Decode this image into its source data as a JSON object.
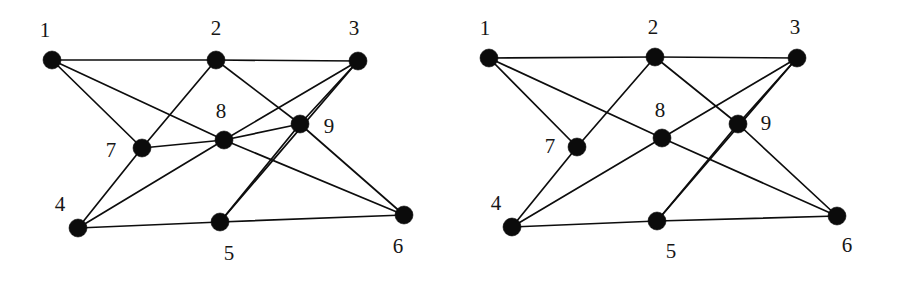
{
  "figure": {
    "background_color": "#ffffff",
    "ink_color": "#0b0b0b",
    "width": 898,
    "height": 282
  },
  "chart_data": {
    "type": "diagram",
    "subtype": "graph-drawing-pair",
    "title": "",
    "panels": [
      {
        "name": "left-graph",
        "label": "",
        "node_radius": 9,
        "nodes": [
          {
            "id": "1",
            "label": "1",
            "x": 52,
            "y": 60,
            "label_x": 45,
            "label_y": 32
          },
          {
            "id": "2",
            "label": "2",
            "x": 216,
            "y": 60,
            "label_x": 216,
            "label_y": 30
          },
          {
            "id": "3",
            "label": "3",
            "x": 358,
            "y": 61,
            "label_x": 354,
            "label_y": 30
          },
          {
            "id": "4",
            "label": "4",
            "x": 78,
            "y": 228,
            "label_x": 60,
            "label_y": 206
          },
          {
            "id": "5",
            "label": "5",
            "x": 220,
            "y": 222,
            "label_x": 229,
            "label_y": 255
          },
          {
            "id": "6",
            "label": "6",
            "x": 404,
            "y": 215,
            "label_x": 398,
            "label_y": 248
          },
          {
            "id": "7",
            "label": "7",
            "x": 142,
            "y": 148,
            "label_x": 111,
            "label_y": 152
          },
          {
            "id": "8",
            "label": "8",
            "x": 224,
            "y": 140,
            "label_x": 221,
            "label_y": 113
          },
          {
            "id": "9",
            "label": "9",
            "x": 300,
            "y": 124,
            "label_x": 329,
            "label_y": 128
          }
        ],
        "edges": [
          [
            "1",
            "2"
          ],
          [
            "2",
            "3"
          ],
          [
            "1",
            "7"
          ],
          [
            "1",
            "8"
          ],
          [
            "2",
            "7"
          ],
          [
            "2",
            "9"
          ],
          [
            "3",
            "8"
          ],
          [
            "3",
            "9"
          ],
          [
            "3",
            "5"
          ],
          [
            "4",
            "7"
          ],
          [
            "4",
            "8"
          ],
          [
            "4",
            "5"
          ],
          [
            "5",
            "9"
          ],
          [
            "5",
            "6"
          ],
          [
            "6",
            "8"
          ],
          [
            "6",
            "9"
          ],
          [
            "7",
            "8"
          ],
          [
            "8",
            "9"
          ]
        ],
        "edge_count": 18,
        "node_count": 9
      },
      {
        "name": "right-graph",
        "label": "",
        "node_radius": 9,
        "nodes": [
          {
            "id": "1",
            "label": "1",
            "x": 40,
            "y": 58,
            "label_x": 36,
            "label_y": 30
          },
          {
            "id": "2",
            "label": "2",
            "x": 206,
            "y": 57,
            "label_x": 204,
            "label_y": 29
          },
          {
            "id": "3",
            "label": "3",
            "x": 348,
            "y": 58,
            "label_x": 346,
            "label_y": 29
          },
          {
            "id": "4",
            "label": "4",
            "x": 63,
            "y": 227,
            "label_x": 47,
            "label_y": 205
          },
          {
            "id": "5",
            "label": "5",
            "x": 208,
            "y": 221,
            "label_x": 222,
            "label_y": 253
          },
          {
            "id": "6",
            "label": "6",
            "x": 388,
            "y": 216,
            "label_x": 398,
            "label_y": 247
          },
          {
            "id": "7",
            "label": "7",
            "x": 128,
            "y": 147,
            "label_x": 101,
            "label_y": 148
          },
          {
            "id": "8",
            "label": "8",
            "x": 213,
            "y": 138,
            "label_x": 211,
            "label_y": 112
          },
          {
            "id": "9",
            "label": "9",
            "x": 289,
            "y": 124,
            "label_x": 317,
            "label_y": 125
          }
        ],
        "edges": [
          [
            "1",
            "2"
          ],
          [
            "2",
            "3"
          ],
          [
            "1",
            "7"
          ],
          [
            "1",
            "8"
          ],
          [
            "2",
            "7"
          ],
          [
            "2",
            "9"
          ],
          [
            "3",
            "8"
          ],
          [
            "3",
            "9"
          ],
          [
            "3",
            "5"
          ],
          [
            "4",
            "7"
          ],
          [
            "4",
            "8"
          ],
          [
            "4",
            "5"
          ],
          [
            "5",
            "9"
          ],
          [
            "5",
            "6"
          ],
          [
            "6",
            "8"
          ],
          [
            "6",
            "9"
          ]
        ],
        "edge_count": 16,
        "node_count": 9
      }
    ]
  }
}
